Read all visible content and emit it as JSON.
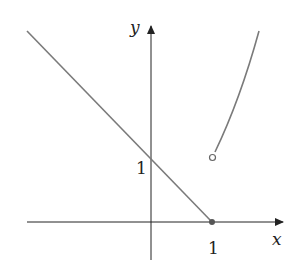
{
  "figure": {
    "axes": {
      "x_label": "x",
      "y_label": "y",
      "x_tick_label": "1",
      "y_tick_label": "1"
    },
    "pieces": [
      {
        "name": "line",
        "formula_shape": "y = 1 - x for x <= 1",
        "endpoint": {
          "x": 1,
          "y": 0,
          "type": "closed"
        }
      },
      {
        "name": "curve",
        "formula_shape": "increasing curve for x > 1",
        "endpoint": {
          "x": 1,
          "y": 1,
          "type": "open"
        }
      }
    ],
    "colors": {
      "axis": "#222222",
      "curve": "#7a7a7a",
      "dot": "#555555"
    }
  }
}
